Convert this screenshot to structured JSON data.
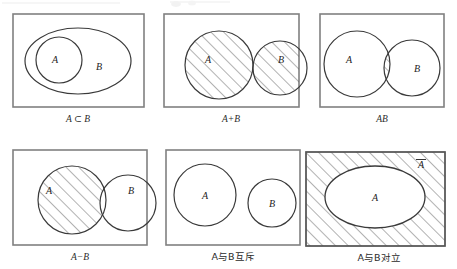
{
  "figure": {
    "background_color": "#ffffff",
    "stroke_color": "#3a3a3a",
    "box_stroke_color": "#808080",
    "hatch_color": "#555555",
    "text_color": "#2b2b2b",
    "rows": 2,
    "columns": 3
  },
  "panels": [
    {
      "id": "subset",
      "caption": "A ⊂ B",
      "caption_kind": "math",
      "labels": {
        "a": "A",
        "b": "B"
      },
      "shading": "none",
      "relation": "A is a subset of B"
    },
    {
      "id": "union",
      "caption": "A+B",
      "caption_kind": "math",
      "labels": {
        "a": "A",
        "b": "B"
      },
      "shading": "both-circles",
      "relation": "union of A and B"
    },
    {
      "id": "intersection",
      "caption": "AB",
      "caption_kind": "math",
      "labels": {
        "a": "A",
        "b": "B"
      },
      "shading": "overlap-only",
      "relation": "intersection of A and B"
    },
    {
      "id": "difference",
      "caption": "A−B",
      "caption_kind": "math",
      "labels": {
        "a": "A",
        "b": "B"
      },
      "shading": "a-minus-b",
      "relation": "A minus B"
    },
    {
      "id": "mutually-exclusive",
      "caption": "A与B互斥",
      "caption_kind": "cjk",
      "labels": {
        "a": "A",
        "b": "B"
      },
      "shading": "none",
      "relation": "A and B are mutually exclusive"
    },
    {
      "id": "complement",
      "caption": "A与B对立",
      "caption_kind": "cjk",
      "labels": {
        "a": "A",
        "complement": "A"
      },
      "shading": "outside-ellipse",
      "relation": "A and B are complementary"
    }
  ]
}
